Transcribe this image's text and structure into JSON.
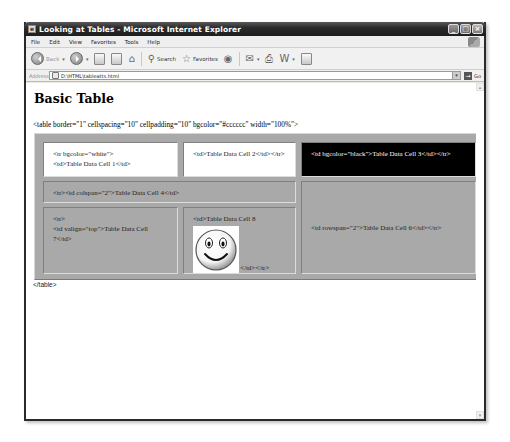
{
  "window": {
    "title": "Looking at Tables - Microsoft Internet Explorer",
    "controls": {
      "minimize": "_",
      "maximize": "□",
      "close": "×"
    }
  },
  "menubar": {
    "items": [
      "File",
      "Edit",
      "View",
      "Favorites",
      "Tools",
      "Help"
    ]
  },
  "toolbar": {
    "back_label": "Back",
    "search_label": "Search",
    "favorites_label": "Favorites"
  },
  "addressbar": {
    "label": "Address",
    "url": "D:\\HTML\\tableatts.html",
    "go_label": "Go"
  },
  "page": {
    "heading": "Basic Table",
    "table_open_code": "<table border=\"1\" cellspacing=\"10\" cellpadding=\"10\" bgcolor=\"#cccccc\" width=\"100%\">",
    "table_close_code": "</table>",
    "cells": {
      "cell1_line1": "<tr bgcolor=\"white\">",
      "cell1_line2": "<td>Table Data Cell 1</td>",
      "cell2": "<td>Table Data Cell 2</td></tr>",
      "cell3": "<td bgcolor=\"black\">Table Data Cell 3</td></tr>",
      "cell4": "<tr><td colspan=\"2\">Table Data Cell 4</td>",
      "cell6": "<td rowspan=\"2\">Table Data Cell 6</td></tr>",
      "cell7_line1": "<tr>",
      "cell7_line2": "<td valign=\"top\">Table Data Cell 7</td>",
      "cell8_text": "<td>Table Data Cell 8",
      "cell8_close": "</td></tr>"
    },
    "image_alt": "smiley face"
  },
  "colors": {
    "table_bg": "#cccccc",
    "white_row": "#ffffff",
    "black_cell": "#000000"
  }
}
